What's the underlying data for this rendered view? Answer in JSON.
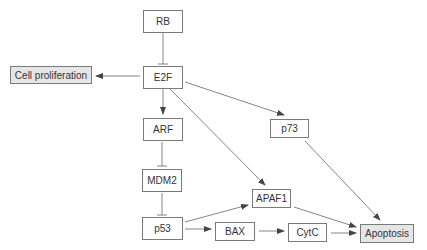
{
  "diagram": {
    "type": "pathway",
    "colors": {
      "line": "#555555",
      "box_border": "#7a7a7a",
      "outcome_fill": "#e6e6e6"
    },
    "nodes": {
      "rb": {
        "label": "RB",
        "x": 143,
        "y": 10,
        "w": 40,
        "h": 23,
        "outcome": false
      },
      "e2f": {
        "label": "E2F",
        "x": 143,
        "y": 66,
        "w": 40,
        "h": 23,
        "outcome": false
      },
      "cell": {
        "label": "Cell proliferation",
        "x": 10,
        "y": 65,
        "w": 82,
        "h": 18,
        "outcome": true
      },
      "arf": {
        "label": "ARF",
        "x": 143,
        "y": 118,
        "w": 40,
        "h": 23,
        "outcome": false
      },
      "mdm2": {
        "label": "MDM2",
        "x": 142,
        "y": 169,
        "w": 40,
        "h": 23,
        "outcome": false
      },
      "p53": {
        "label": "p53",
        "x": 142,
        "y": 217,
        "w": 40,
        "h": 23,
        "outcome": false
      },
      "bax": {
        "label": "BAX",
        "x": 215,
        "y": 222,
        "w": 40,
        "h": 19,
        "outcome": false
      },
      "cytc": {
        "label": "CytC",
        "x": 288,
        "y": 222,
        "w": 39,
        "h": 19,
        "outcome": false
      },
      "apaf1": {
        "label": "APAF1",
        "x": 252,
        "y": 189,
        "w": 39,
        "h": 19,
        "outcome": false
      },
      "p73": {
        "label": "p73",
        "x": 270,
        "y": 119,
        "w": 39,
        "h": 19,
        "outcome": false
      },
      "apoptosis": {
        "label": "Apoptosis",
        "x": 360,
        "y": 224,
        "w": 54,
        "h": 19,
        "outcome": true
      }
    },
    "edges": [
      {
        "from": "RB",
        "to": "E2F",
        "type": "inhibit"
      },
      {
        "from": "E2F",
        "to": "Cell proliferation",
        "type": "activate"
      },
      {
        "from": "E2F",
        "to": "ARF",
        "type": "activate"
      },
      {
        "from": "E2F",
        "to": "p73",
        "type": "activate"
      },
      {
        "from": "E2F",
        "to": "APAF1",
        "type": "activate"
      },
      {
        "from": "ARF",
        "to": "MDM2",
        "type": "inhibit"
      },
      {
        "from": "MDM2",
        "to": "p53",
        "type": "inhibit"
      },
      {
        "from": "p53",
        "to": "APAF1",
        "type": "activate"
      },
      {
        "from": "p53",
        "to": "BAX",
        "type": "activate"
      },
      {
        "from": "BAX",
        "to": "CytC",
        "type": "activate"
      },
      {
        "from": "CytC",
        "to": "Apoptosis",
        "type": "activate"
      },
      {
        "from": "APAF1",
        "to": "Apoptosis",
        "type": "activate"
      },
      {
        "from": "p73",
        "to": "Apoptosis",
        "type": "activate"
      }
    ]
  }
}
